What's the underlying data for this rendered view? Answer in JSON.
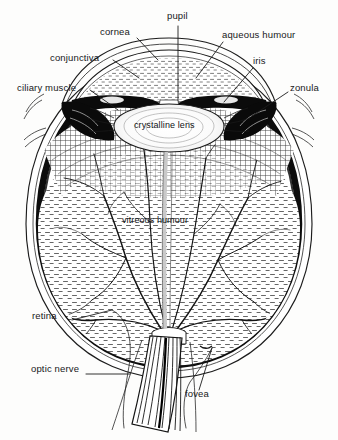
{
  "figure": {
    "type": "anatomical-diagram",
    "ink_color": "#1a1a1a",
    "paper_color": "#fdfdfc",
    "sclera_color": "#111111"
  },
  "labels": [
    {
      "id": "pupil",
      "text": "pupil",
      "x": 167,
      "y": 16,
      "anchor": "start"
    },
    {
      "id": "cornea",
      "text": "cornea",
      "x": 100,
      "y": 32,
      "anchor": "start"
    },
    {
      "id": "aqueous_humour",
      "text": "aqueous humour",
      "x": 222,
      "y": 35,
      "anchor": "start"
    },
    {
      "id": "conjunctiva",
      "text": "conjunctiva",
      "x": 50,
      "y": 58,
      "anchor": "start"
    },
    {
      "id": "iris",
      "text": "iris",
      "x": 253,
      "y": 61,
      "anchor": "start"
    },
    {
      "id": "ciliary_muscle",
      "text": "ciliary muscle",
      "x": 17,
      "y": 88,
      "anchor": "start"
    },
    {
      "id": "zonula",
      "text": "zonula",
      "x": 290,
      "y": 88,
      "anchor": "start"
    },
    {
      "id": "crystalline_lens",
      "text": "crystalline lens",
      "x": 134,
      "y": 121,
      "anchor": "start"
    },
    {
      "id": "vitreous_humour",
      "text": "vitreous humour",
      "x": 122,
      "y": 216,
      "anchor": "start"
    },
    {
      "id": "retina",
      "text": "retina",
      "x": 32,
      "y": 316,
      "anchor": "start"
    },
    {
      "id": "optic_nerve",
      "text": "optic nerve",
      "x": 31,
      "y": 369,
      "anchor": "start"
    },
    {
      "id": "fovea",
      "text": "fovea",
      "x": 185,
      "y": 394,
      "anchor": "start"
    }
  ],
  "structures": [
    {
      "id": "cornea",
      "name": "cornea"
    },
    {
      "id": "conjunctiva",
      "name": "conjunctiva"
    },
    {
      "id": "anterior-chamber",
      "name": "aqueous humour"
    },
    {
      "id": "iris",
      "name": "iris"
    },
    {
      "id": "pupil",
      "name": "pupil"
    },
    {
      "id": "lens",
      "name": "crystalline lens"
    },
    {
      "id": "zonula",
      "name": "zonula fibres"
    },
    {
      "id": "ciliary-muscle",
      "name": "ciliary muscle"
    },
    {
      "id": "vitreous",
      "name": "vitreous humour"
    },
    {
      "id": "retina",
      "name": "retina"
    },
    {
      "id": "sclera",
      "name": "sclera"
    },
    {
      "id": "fovea",
      "name": "fovea"
    },
    {
      "id": "optic-nerve",
      "name": "optic nerve"
    }
  ]
}
